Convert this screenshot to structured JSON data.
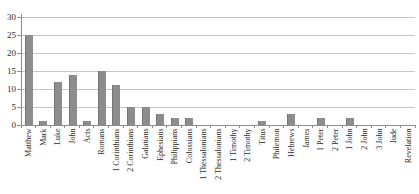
{
  "window": {
    "background": "#ffffff"
  },
  "chart_data": {
    "type": "bar",
    "title": "",
    "xlabel": "",
    "ylabel": "",
    "categories": [
      "Matthew",
      "Mark",
      "Luke",
      "John",
      "Acts",
      "Romans",
      "1 Corinthians",
      "2 Corinthians",
      "Galatians",
      "Ephesians",
      "Philippians",
      "Colossians",
      "1 Thessalonians",
      "2 Thessalonians",
      "1 Timothy",
      "2 Timothy",
      "Titus",
      "Philemon",
      "Hebrews",
      "James",
      "1 Peter",
      "2 Peter",
      "1 John",
      "2 John",
      "3 John",
      "Jude",
      "Revelation"
    ],
    "values": [
      25,
      1,
      12,
      14,
      1,
      15,
      11,
      5,
      5,
      3,
      2,
      2,
      0,
      0,
      0,
      0,
      1,
      0,
      3,
      0,
      2,
      0,
      2,
      0,
      0,
      0,
      0
    ],
    "ylim": [
      0,
      30
    ],
    "ytick_step": 5,
    "ytick_labels": [
      "0",
      "5",
      "10",
      "15",
      "20",
      "25",
      "30"
    ],
    "grid": true,
    "legend": "none",
    "colors": {
      "bar_fill": "#8d8d8d",
      "bar_edge": "#757575",
      "gridline": "#c6c6c6",
      "axis_line": "#8c8c8c",
      "tick": "#8c8c8c",
      "text": "#2b2b2b",
      "background": "#ffffff"
    }
  }
}
